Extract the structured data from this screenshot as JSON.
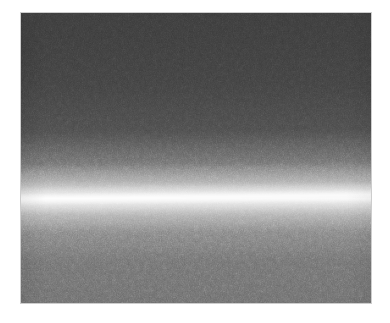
{
  "page": {
    "background_color": "#ffffff",
    "width": 390,
    "height": 323
  },
  "figure": {
    "name": "grayscale-band-image",
    "border_color": "#cdcdcd",
    "frame": {
      "x": 21,
      "y": 13,
      "width": 350,
      "height": 290
    }
  },
  "chart_data": {
    "type": "heatmap",
    "title": "",
    "subtitle": "",
    "xlabel": "",
    "ylabel": "",
    "colormap": "grayscale",
    "grid": false,
    "legend": "none",
    "axis_visible": false,
    "tick_labels_x": [],
    "tick_labels_y": [],
    "xlim": [
      0,
      350
    ],
    "ylim": [
      0,
      290
    ],
    "band": {
      "peak_row_left_px": 199,
      "peak_row_center_px": 197,
      "peak_row_right_px": 195,
      "tilt_degrees": -0.7,
      "core_half_width_px": 4,
      "halo_half_width_px": 34,
      "peak_gray_value": 232,
      "peak_hex": "#e8e8e8"
    },
    "profile_stops": [
      {
        "position_pct": 0,
        "gray": 56,
        "hex": "#383838"
      },
      {
        "position_pct": 10,
        "gray": 58,
        "hex": "#3a3a3a"
      },
      {
        "position_pct": 25,
        "gray": 62,
        "hex": "#3e3e3e"
      },
      {
        "position_pct": 40,
        "gray": 72,
        "hex": "#484848"
      },
      {
        "position_pct": 52,
        "gray": 92,
        "hex": "#5c5c5c"
      },
      {
        "position_pct": 58,
        "gray": 125,
        "hex": "#7d7d7d"
      },
      {
        "position_pct": 62,
        "gray": 180,
        "hex": "#b4b4b4"
      },
      {
        "position_pct": 64,
        "gray": 232,
        "hex": "#e8e8e8"
      },
      {
        "position_pct": 66,
        "gray": 186,
        "hex": "#bababa"
      },
      {
        "position_pct": 70,
        "gray": 140,
        "hex": "#8c8c8c"
      },
      {
        "position_pct": 76,
        "gray": 116,
        "hex": "#747474"
      },
      {
        "position_pct": 85,
        "gray": 108,
        "hex": "#6c6c6c"
      },
      {
        "position_pct": 100,
        "gray": 104,
        "hex": "#686868"
      }
    ],
    "noise": {
      "type": "film-grain",
      "amplitude_pct": 6,
      "scale_px": 2
    }
  }
}
